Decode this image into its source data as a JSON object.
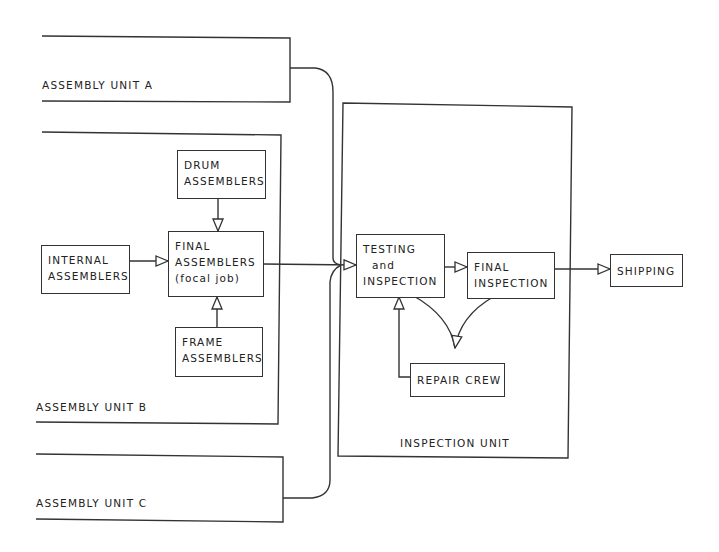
{
  "diagram": {
    "type": "flowchart",
    "units": {
      "assembly_a": {
        "label": "ASSEMBLY UNIT A"
      },
      "assembly_b": {
        "label": "ASSEMBLY UNIT B"
      },
      "assembly_c": {
        "label": "ASSEMBLY UNIT C"
      },
      "inspection": {
        "label": "INSPECTION UNIT"
      }
    },
    "nodes": {
      "drum": {
        "label": "DRUM\nASSEMBLERS"
      },
      "internal": {
        "label": "INTERNAL\nASSEMBLERS"
      },
      "final_assemblers": {
        "label": "FINAL\nASSEMBLERS\n(focal job)"
      },
      "frame": {
        "label": "FRAME\nASSEMBLERS"
      },
      "testing": {
        "label": "TESTING\n  and\nINSPECTION"
      },
      "final_inspection": {
        "label": "FINAL\nINSPECTION"
      },
      "repair": {
        "label": "REPAIR CREW"
      },
      "shipping": {
        "label": "SHIPPING"
      }
    },
    "edges": [
      {
        "from": "DRUM ASSEMBLERS",
        "to": "FINAL ASSEMBLERS"
      },
      {
        "from": "INTERNAL ASSEMBLERS",
        "to": "FINAL ASSEMBLERS"
      },
      {
        "from": "FRAME ASSEMBLERS",
        "to": "FINAL ASSEMBLERS"
      },
      {
        "from": "FINAL ASSEMBLERS",
        "to": "TESTING and INSPECTION"
      },
      {
        "from": "ASSEMBLY UNIT A",
        "to": "TESTING and INSPECTION"
      },
      {
        "from": "ASSEMBLY UNIT C",
        "to": "TESTING and INSPECTION"
      },
      {
        "from": "TESTING and INSPECTION",
        "to": "FINAL INSPECTION"
      },
      {
        "from": "TESTING and INSPECTION",
        "to": "REPAIR CREW"
      },
      {
        "from": "FINAL INSPECTION",
        "to": "REPAIR CREW"
      },
      {
        "from": "REPAIR CREW",
        "to": "TESTING and INSPECTION"
      },
      {
        "from": "FINAL INSPECTION",
        "to": "SHIPPING"
      }
    ]
  }
}
